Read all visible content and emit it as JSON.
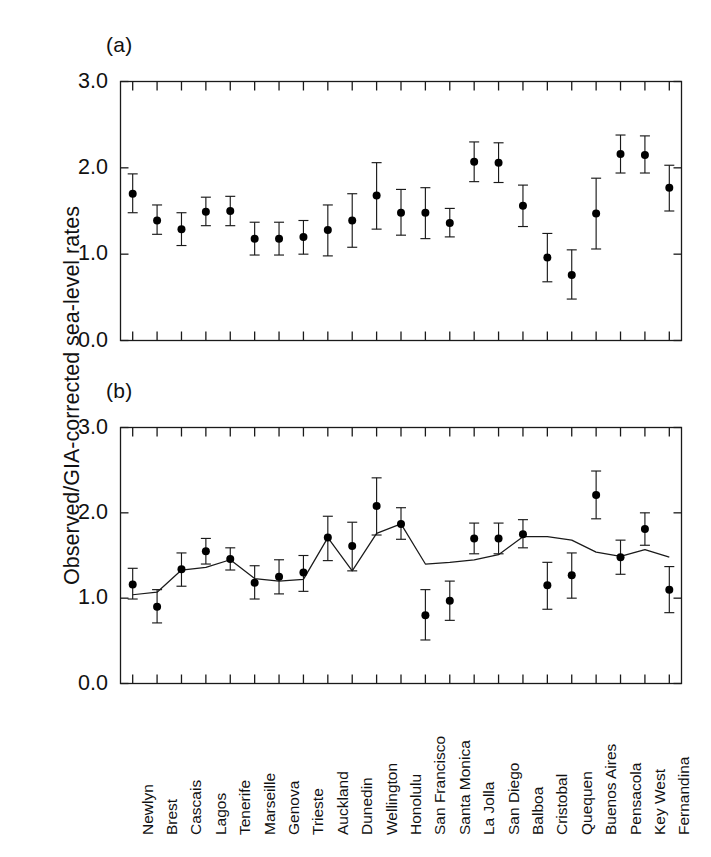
{
  "figure": {
    "title": "",
    "ylabel": "Observed/GIA-corrected sea-level rates",
    "panel_a_tag": "(a)",
    "panel_b_tag": "(b)"
  },
  "axis": {
    "ytick_labels": [
      "3.0",
      "2.0",
      "1.0",
      "0.0"
    ],
    "ytick_values": [
      3.0,
      2.0,
      1.0,
      0.0
    ]
  },
  "chart_data": [
    {
      "type": "scatter",
      "panel": "(a)",
      "title": "",
      "xlabel": "",
      "ylabel": "Observed/GIA-corrected sea-level rates",
      "ylim": [
        0.0,
        3.0
      ],
      "yticks": [
        0.0,
        1.0,
        2.0,
        3.0
      ],
      "grid": false,
      "legend": "none",
      "error_bars": true,
      "categories": [
        "Newlyn",
        "Brest",
        "Cascais",
        "Lagos",
        "Tenerife",
        "Marseille",
        "Genova",
        "Trieste",
        "Auckland",
        "Dunedin",
        "Wellington",
        "Honolulu",
        "San Francisco",
        "Santa Monica",
        "La Jolla",
        "San Diego",
        "Balboa",
        "Cristobal",
        "Quequen",
        "Buenos Aires",
        "Pensacola",
        "Key West",
        "Fernandina"
      ],
      "series": [
        {
          "name": "Observed/GIA-corrected rate",
          "values": [
            1.7,
            1.39,
            1.29,
            1.49,
            1.5,
            1.18,
            1.18,
            1.2,
            1.28,
            1.39,
            1.68,
            1.48,
            1.48,
            1.36,
            2.07,
            2.06,
            1.56,
            0.96,
            0.76,
            1.47,
            2.16,
            2.15,
            1.77
          ],
          "err_low": [
            1.48,
            1.23,
            1.1,
            1.33,
            1.33,
            0.99,
            0.99,
            1.0,
            0.98,
            1.08,
            1.29,
            1.22,
            1.18,
            1.2,
            1.84,
            1.83,
            1.32,
            0.68,
            0.48,
            1.06,
            1.94,
            1.94,
            1.5
          ],
          "err_high": [
            1.93,
            1.57,
            1.48,
            1.66,
            1.67,
            1.37,
            1.37,
            1.39,
            1.57,
            1.7,
            2.06,
            1.75,
            1.77,
            1.53,
            2.3,
            2.29,
            1.8,
            1.24,
            1.05,
            1.88,
            2.38,
            2.37,
            2.03
          ]
        }
      ]
    },
    {
      "type": "scatter",
      "panel": "(b)",
      "title": "",
      "xlabel": "",
      "ylabel": "Observed/GIA-corrected sea-level rates",
      "ylim": [
        0.0,
        3.0
      ],
      "yticks": [
        0.0,
        1.0,
        2.0,
        3.0
      ],
      "grid": false,
      "legend": "none",
      "error_bars": true,
      "categories": [
        "Newlyn",
        "Brest",
        "Cascais",
        "Lagos",
        "Tenerife",
        "Marseille",
        "Genova",
        "Trieste",
        "Auckland",
        "Dunedin",
        "Wellington",
        "Honolulu",
        "San Francisco",
        "Santa Monica",
        "La Jolla",
        "San Diego",
        "Balboa",
        "Cristobal",
        "Quequen",
        "Buenos Aires",
        "Pensacola",
        "Key West",
        "Fernandina"
      ],
      "series": [
        {
          "name": "Observed/GIA-corrected rate",
          "values": [
            1.16,
            0.9,
            1.34,
            1.55,
            1.46,
            1.18,
            1.25,
            1.3,
            1.71,
            1.61,
            2.08,
            1.87,
            0.8,
            0.97,
            1.7,
            1.7,
            1.75,
            1.15,
            1.27,
            2.21,
            1.48,
            1.81,
            1.1
          ],
          "err_low": [
            0.99,
            0.71,
            1.14,
            1.4,
            1.33,
            0.99,
            1.05,
            1.08,
            1.44,
            1.32,
            1.74,
            1.69,
            0.51,
            0.74,
            1.52,
            1.52,
            1.59,
            0.87,
            1.0,
            1.93,
            1.28,
            1.62,
            0.83
          ],
          "err_high": [
            1.35,
            1.1,
            1.53,
            1.7,
            1.59,
            1.38,
            1.45,
            1.5,
            1.96,
            1.89,
            2.41,
            2.06,
            1.1,
            1.2,
            1.88,
            1.88,
            1.92,
            1.42,
            1.53,
            2.49,
            1.68,
            2.0,
            1.37
          ]
        },
        {
          "name": "Model curve",
          "type": "line",
          "values": [
            1.04,
            1.07,
            1.33,
            1.36,
            1.45,
            1.23,
            1.2,
            1.22,
            1.71,
            1.32,
            1.76,
            1.87,
            1.4,
            1.42,
            1.45,
            1.51,
            1.72,
            1.72,
            1.68,
            1.54,
            1.49,
            1.57,
            1.48
          ]
        }
      ]
    }
  ]
}
